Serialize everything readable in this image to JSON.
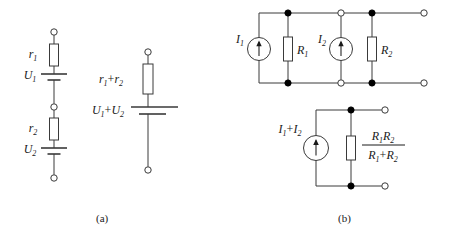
{
  "figure": {
    "background_color": "#ffffff",
    "line_color": "#3a3a3a",
    "text_color": "#1a1a1a",
    "node_fill_color": "#000000",
    "terminal_fill_color": "#ffffff"
  },
  "captions": {
    "a": "(a)",
    "b": "(b)"
  },
  "panel_a": {
    "caption": "(a)",
    "description": "Series voltage sources with internal resistances combine into one source",
    "original_circuit": {
      "name": "series-branch",
      "components": [
        {
          "type": "terminal",
          "name": "terminal-top-a"
        },
        {
          "type": "resistor",
          "name": "resistor-r1",
          "label": "r",
          "sub": "1"
        },
        {
          "type": "battery",
          "name": "battery-u1",
          "label": "U",
          "sub": "1"
        },
        {
          "type": "terminal",
          "name": "terminal-mid-a"
        },
        {
          "type": "resistor",
          "name": "resistor-r2",
          "label": "r",
          "sub": "2"
        },
        {
          "type": "battery",
          "name": "battery-u2",
          "label": "U",
          "sub": "2"
        },
        {
          "type": "terminal",
          "name": "terminal-bottom-a"
        }
      ],
      "labels": {
        "r1_base": "r",
        "r1_sub": "1",
        "u1_base": "U",
        "u1_sub": "1",
        "r2_base": "r",
        "r2_sub": "2",
        "u2_base": "U",
        "u2_sub": "2"
      }
    },
    "equivalent_circuit": {
      "name": "series-equivalent-branch",
      "components": [
        {
          "type": "terminal",
          "name": "terminal-top-a-eq"
        },
        {
          "type": "resistor",
          "name": "resistor-r1-plus-r2"
        },
        {
          "type": "battery",
          "name": "battery-u1-plus-u2"
        },
        {
          "type": "terminal",
          "name": "terminal-bottom-a-eq"
        }
      ],
      "labels": {
        "resistance_base_1": "r",
        "resistance_sub_1": "1",
        "resistance_plus": "+",
        "resistance_base_2": "r",
        "resistance_sub_2": "2",
        "voltage_base_1": "U",
        "voltage_sub_1": "1",
        "voltage_plus": "+",
        "voltage_base_2": "U",
        "voltage_sub_2": "2"
      }
    }
  },
  "panel_b": {
    "caption": "(b)",
    "description": "Parallel current sources with shunt resistances combine into one source",
    "original_circuit": {
      "name": "parallel-network",
      "components": [
        {
          "type": "current-source",
          "name": "current-source-i1",
          "label": "I",
          "sub": "1"
        },
        {
          "type": "resistor",
          "name": "resistor-R1",
          "label": "R",
          "sub": "1"
        },
        {
          "type": "current-source",
          "name": "current-source-i2",
          "label": "I",
          "sub": "2"
        },
        {
          "type": "resistor",
          "name": "resistor-R2",
          "label": "R",
          "sub": "2"
        },
        {
          "type": "terminal",
          "name": "terminal-top-right-b"
        },
        {
          "type": "terminal",
          "name": "terminal-bottom-right-b"
        }
      ],
      "labels": {
        "i1_base": "I",
        "i1_sub": "1",
        "R1_base": "R",
        "R1_sub": "1",
        "i2_base": "I",
        "i2_sub": "2",
        "R2_base": "R",
        "R2_sub": "2"
      }
    },
    "equivalent_circuit": {
      "name": "parallel-equivalent-network",
      "components": [
        {
          "type": "current-source",
          "name": "current-source-i1-plus-i2"
        },
        {
          "type": "resistor",
          "name": "resistor-parallel-combination"
        },
        {
          "type": "terminal",
          "name": "terminal-top-right-b-eq"
        },
        {
          "type": "terminal",
          "name": "terminal-bottom-right-b-eq"
        }
      ],
      "labels": {
        "current_base_1": "I",
        "current_sub_1": "1",
        "current_plus": "+",
        "current_base_2": "I",
        "current_sub_2": "2",
        "numerator_base_1": "R",
        "numerator_sub_1": "1",
        "numerator_base_2": "R",
        "numerator_sub_2": "2",
        "denominator_base_1": "R",
        "denominator_sub_1": "1",
        "denominator_plus": "+",
        "denominator_base_2": "R",
        "denominator_sub_2": "2"
      }
    }
  }
}
